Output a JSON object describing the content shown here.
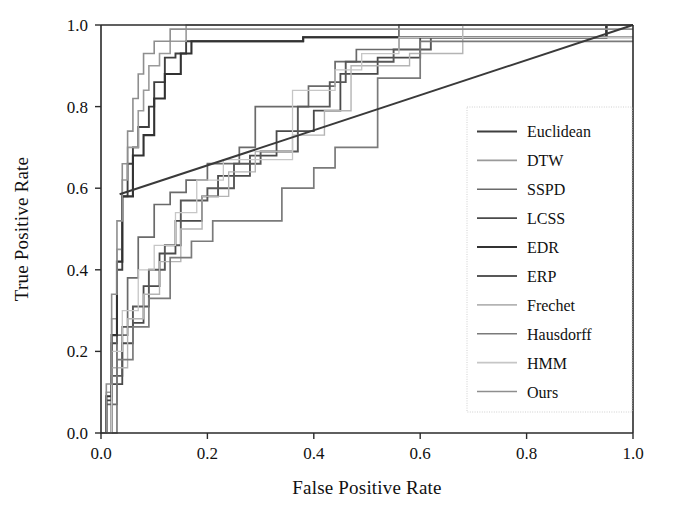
{
  "figure": {
    "background_color": "#ffffff",
    "axis_color": "#2b2b2b"
  },
  "chart_data": {
    "type": "line",
    "title": "",
    "subtitle": "",
    "xlabel": "False Positive Rate",
    "ylabel": "True Positive Rate",
    "xlim": [
      0.0,
      1.0
    ],
    "ylim": [
      0.0,
      1.0
    ],
    "xticks": [
      "0.0",
      "0.2",
      "0.4",
      "0.6",
      "0.8",
      "1.0"
    ],
    "xtick_values": [
      0.0,
      0.2,
      0.4,
      0.6,
      0.8,
      1.0
    ],
    "yticks": [
      "0.0",
      "0.2",
      "0.4",
      "0.6",
      "0.8",
      "1.0"
    ],
    "ytick_values": [
      0.0,
      0.2,
      0.4,
      0.6,
      0.8,
      1.0
    ],
    "grid": false,
    "legend_position": "lower right",
    "step_style": "post",
    "annotations": [],
    "series": [
      {
        "name": "Euclidean",
        "color": "#3f3f3f",
        "width": 1.9,
        "dash": "none",
        "x": [
          0.0,
          0.01,
          0.01,
          0.02,
          0.02,
          0.03,
          0.03,
          0.04,
          0.04,
          0.05,
          0.05,
          0.06,
          0.06,
          0.07,
          0.07,
          0.09,
          0.09,
          0.1,
          0.1,
          0.12,
          0.12,
          0.14,
          0.14,
          0.16,
          0.16,
          0.38,
          0.38,
          0.55,
          0.55,
          0.95,
          0.95,
          1.0
        ],
        "y": [
          0.0,
          0.0,
          0.08,
          0.08,
          0.22,
          0.22,
          0.4,
          0.4,
          0.58,
          0.58,
          0.66,
          0.66,
          0.7,
          0.7,
          0.75,
          0.75,
          0.8,
          0.8,
          0.86,
          0.86,
          0.92,
          0.92,
          0.93,
          0.93,
          0.96,
          0.96,
          0.97,
          0.97,
          0.97,
          0.97,
          1.0,
          1.0
        ]
      },
      {
        "name": "DTW",
        "color": "#9a9a9a",
        "width": 1.6,
        "dash": "none",
        "x": [
          0.0,
          0.01,
          0.01,
          0.02,
          0.02,
          0.03,
          0.03,
          0.04,
          0.04,
          0.05,
          0.05,
          0.07,
          0.07,
          0.08,
          0.08,
          0.09,
          0.09,
          0.11,
          0.11,
          0.13,
          0.13,
          0.16,
          0.16,
          1.0
        ],
        "y": [
          0.0,
          0.0,
          0.1,
          0.1,
          0.28,
          0.28,
          0.45,
          0.45,
          0.62,
          0.62,
          0.7,
          0.7,
          0.79,
          0.79,
          0.84,
          0.84,
          0.9,
          0.9,
          0.93,
          0.93,
          0.96,
          0.96,
          1.0,
          1.0
        ]
      },
      {
        "name": "SSPD",
        "color": "#6a6a6a",
        "width": 1.7,
        "dash": "none",
        "x": [
          0.0,
          0.01,
          0.01,
          0.03,
          0.03,
          0.05,
          0.05,
          0.07,
          0.07,
          0.1,
          0.1,
          0.13,
          0.13,
          0.16,
          0.16,
          0.2,
          0.2,
          0.26,
          0.26,
          0.29,
          0.29,
          0.39,
          0.39,
          0.44,
          0.44,
          0.48,
          0.48,
          0.56,
          0.56,
          0.67,
          0.67,
          1.0
        ],
        "y": [
          0.0,
          0.0,
          0.07,
          0.07,
          0.24,
          0.24,
          0.38,
          0.38,
          0.48,
          0.48,
          0.56,
          0.56,
          0.59,
          0.59,
          0.62,
          0.62,
          0.66,
          0.66,
          0.7,
          0.7,
          0.8,
          0.8,
          0.85,
          0.85,
          0.91,
          0.91,
          0.94,
          0.94,
          1.0,
          1.0,
          1.0,
          1.0
        ]
      },
      {
        "name": "LCSS",
        "color": "#4a4a4a",
        "width": 1.8,
        "dash": "none",
        "x": [
          0.0,
          0.02,
          0.02,
          0.04,
          0.04,
          0.06,
          0.06,
          0.08,
          0.08,
          0.11,
          0.11,
          0.14,
          0.14,
          0.19,
          0.19,
          0.22,
          0.22,
          0.28,
          0.28,
          0.33,
          0.33,
          0.4,
          0.4,
          0.45,
          0.45,
          0.52,
          0.52,
          0.6,
          0.6,
          0.95,
          0.95,
          1.0
        ],
        "y": [
          0.0,
          0.0,
          0.12,
          0.12,
          0.22,
          0.22,
          0.27,
          0.27,
          0.36,
          0.36,
          0.44,
          0.44,
          0.52,
          0.52,
          0.58,
          0.58,
          0.63,
          0.63,
          0.68,
          0.68,
          0.74,
          0.74,
          0.79,
          0.79,
          0.88,
          0.88,
          0.92,
          0.92,
          0.97,
          0.97,
          1.0,
          1.0
        ]
      },
      {
        "name": "EDR",
        "color": "#323232",
        "width": 2.1,
        "dash": "none",
        "x": [
          0.0,
          0.01,
          0.01,
          0.02,
          0.02,
          0.03,
          0.03,
          0.04,
          0.04,
          0.06,
          0.06,
          0.08,
          0.08,
          0.1,
          0.1,
          0.12,
          0.12,
          0.15,
          0.15,
          0.17,
          0.17,
          0.38,
          0.38,
          0.44,
          0.44,
          0.55,
          0.55,
          0.95,
          0.95,
          1.0
        ],
        "y": [
          0.0,
          0.0,
          0.09,
          0.09,
          0.24,
          0.24,
          0.42,
          0.42,
          0.58,
          0.58,
          0.68,
          0.68,
          0.73,
          0.73,
          0.82,
          0.82,
          0.88,
          0.88,
          0.93,
          0.93,
          0.96,
          0.96,
          0.97,
          0.97,
          0.97,
          0.97,
          0.97,
          0.97,
          1.0,
          1.0
        ]
      },
      {
        "name": "ERP",
        "color": "#585858",
        "width": 1.9,
        "dash": "none",
        "x": [
          0.0,
          0.02,
          0.02,
          0.04,
          0.04,
          0.06,
          0.06,
          0.09,
          0.09,
          0.12,
          0.12,
          0.15,
          0.15,
          0.2,
          0.2,
          0.25,
          0.25,
          0.3,
          0.3,
          0.37,
          0.37,
          0.43,
          0.43,
          0.46,
          0.46,
          0.55,
          0.55,
          0.62,
          0.62,
          1.0
        ],
        "y": [
          0.0,
          0.0,
          0.14,
          0.14,
          0.26,
          0.26,
          0.31,
          0.31,
          0.4,
          0.4,
          0.46,
          0.46,
          0.57,
          0.57,
          0.6,
          0.6,
          0.66,
          0.66,
          0.69,
          0.69,
          0.8,
          0.8,
          0.86,
          0.86,
          0.91,
          0.91,
          0.94,
          0.94,
          0.97,
          0.97
        ]
      },
      {
        "name": "Frechet",
        "color": "#b4b4b4",
        "width": 1.4,
        "dash": "none",
        "x": [
          0.0,
          0.02,
          0.02,
          0.05,
          0.05,
          0.08,
          0.08,
          0.11,
          0.11,
          0.15,
          0.15,
          0.19,
          0.19,
          0.24,
          0.24,
          0.29,
          0.29,
          0.36,
          0.36,
          0.42,
          0.42,
          0.47,
          0.47,
          0.58,
          0.58,
          0.68,
          0.68,
          1.0
        ],
        "y": [
          0.0,
          0.0,
          0.16,
          0.16,
          0.28,
          0.28,
          0.34,
          0.34,
          0.42,
          0.42,
          0.5,
          0.5,
          0.58,
          0.58,
          0.64,
          0.64,
          0.69,
          0.69,
          0.73,
          0.73,
          0.79,
          0.79,
          0.9,
          0.9,
          0.93,
          0.93,
          1.0,
          1.0
        ]
      },
      {
        "name": "Hausdorff",
        "color": "#7a7a7a",
        "width": 1.7,
        "dash": "none",
        "x": [
          0.0,
          0.03,
          0.03,
          0.06,
          0.06,
          0.09,
          0.09,
          0.13,
          0.13,
          0.17,
          0.17,
          0.21,
          0.21,
          0.28,
          0.28,
          0.34,
          0.34,
          0.4,
          0.4,
          0.44,
          0.44,
          0.52,
          0.52,
          0.6,
          0.6,
          1.0
        ],
        "y": [
          0.0,
          0.0,
          0.18,
          0.18,
          0.26,
          0.26,
          0.33,
          0.33,
          0.43,
          0.43,
          0.47,
          0.47,
          0.52,
          0.52,
          0.52,
          0.52,
          0.6,
          0.6,
          0.65,
          0.65,
          0.7,
          0.7,
          0.87,
          0.87,
          0.96,
          0.96
        ]
      },
      {
        "name": "HMM",
        "color": "#c6c6c6",
        "width": 1.3,
        "dash": "none",
        "x": [
          0.0,
          0.02,
          0.02,
          0.04,
          0.04,
          0.07,
          0.07,
          0.1,
          0.1,
          0.14,
          0.14,
          0.18,
          0.18,
          0.23,
          0.23,
          0.29,
          0.29,
          0.36,
          0.36,
          0.44,
          0.44,
          0.49,
          0.49,
          0.56,
          0.56,
          1.0
        ],
        "y": [
          0.0,
          0.0,
          0.2,
          0.2,
          0.3,
          0.3,
          0.4,
          0.4,
          0.46,
          0.46,
          0.54,
          0.54,
          0.62,
          0.62,
          0.67,
          0.67,
          0.67,
          0.67,
          0.84,
          0.84,
          0.89,
          0.89,
          0.93,
          0.93,
          0.97,
          0.97
        ]
      },
      {
        "name": "Ours",
        "color": "#8e8e8e",
        "width": 1.6,
        "dash": "none",
        "x": [
          0.0,
          0.01,
          0.01,
          0.02,
          0.02,
          0.03,
          0.03,
          0.04,
          0.04,
          0.05,
          0.05,
          0.06,
          0.06,
          0.07,
          0.07,
          0.08,
          0.08,
          0.1,
          0.1,
          0.13,
          0.13,
          1.0
        ],
        "y": [
          0.0,
          0.0,
          0.12,
          0.12,
          0.34,
          0.34,
          0.52,
          0.52,
          0.66,
          0.66,
          0.74,
          0.74,
          0.82,
          0.82,
          0.88,
          0.88,
          0.93,
          0.93,
          0.96,
          0.96,
          0.99,
          0.99
        ]
      }
    ],
    "reference_line": {
      "name": "chance-chord",
      "color": "#3a3a3a",
      "width": 2.0,
      "x": [
        0.035,
        1.0
      ],
      "y": [
        0.585,
        1.0
      ]
    }
  },
  "legend": {
    "entries": [
      {
        "label": "Euclidean"
      },
      {
        "label": "DTW"
      },
      {
        "label": "SSPD"
      },
      {
        "label": "LCSS"
      },
      {
        "label": "EDR"
      },
      {
        "label": "ERP"
      },
      {
        "label": "Frechet"
      },
      {
        "label": "Hausdorff"
      },
      {
        "label": "HMM"
      },
      {
        "label": "Ours"
      }
    ]
  }
}
